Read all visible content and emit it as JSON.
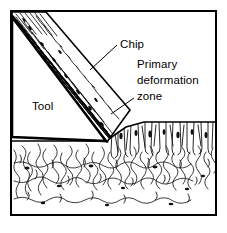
{
  "figure": {
    "frame": {
      "x": 10,
      "y": 10,
      "width": 207,
      "height": 206,
      "stroke": "#000000"
    },
    "background": "#ffffff",
    "ink_color": "#000000"
  },
  "labels": {
    "chip": "Chip",
    "primary": "Primary",
    "deformation": "deformation",
    "zone": "zone",
    "tool": "Tool"
  },
  "label_positions": {
    "chip": {
      "x": 120,
      "y": 48
    },
    "primary": {
      "x": 137,
      "y": 68
    },
    "deformation": {
      "x": 137,
      "y": 84
    },
    "zone": {
      "x": 137,
      "y": 100
    },
    "tool": {
      "x": 32,
      "y": 110
    }
  },
  "leaders": {
    "chip_leader": "M 117 45 L 90 70",
    "zone_leader": "M 134 98 L 111 115"
  },
  "geometry": {
    "tool_outline": "M 12 18 L 106 141 L 12 137 Z",
    "tool_description": "wedge-shaped cutting tool, rake face from upper-left to tool tip",
    "chip_outline": "M 12 12 L 44 12 L 128 110 L 106 141 L 12 18 Z",
    "chip_description": "chip curling up the rake face with deformed lamellar structure",
    "workpiece_surface": "M 106 141 L 128 126 L 145 122 L 216 122",
    "machined_surface": "M 12 141 L 106 141"
  },
  "regions": {
    "tool_label_region": "Tool",
    "chip_label_region": "Chip",
    "shear_zone_label_region": "Primary deformation zone"
  },
  "colors": {
    "ink": "#000000",
    "paper": "#ffffff",
    "grain_line": "#1a1a1a"
  }
}
